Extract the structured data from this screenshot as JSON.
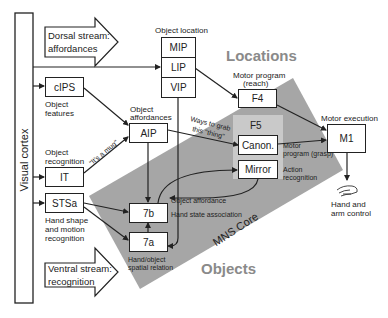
{
  "diagram": {
    "colors": {
      "mns_core": "#a6a6a6",
      "f5_region": "#c9c9c9",
      "region_label": "#8a8a8a",
      "line": "#222222"
    },
    "visual_cortex": "Visual cortex",
    "dorsal_stream": {
      "line1": "Dorsal stream:",
      "line2": "affordances"
    },
    "ventral_stream": {
      "line1": "Ventral stream:",
      "line2": "recognition"
    },
    "object_location": {
      "label": "Object location",
      "boxes": [
        "MIP",
        "LIP",
        "VIP"
      ]
    },
    "regions": {
      "locations": "Locations",
      "objects": "Objects",
      "mns_core": "MNS Core"
    },
    "nodes": {
      "cips": {
        "label": "cIPS",
        "caption1": "Object",
        "caption2": "features"
      },
      "it": {
        "label": "IT",
        "caption1": "Object",
        "caption2": "recognition"
      },
      "stsa": {
        "label": "STSa",
        "caption1": "Hand shape",
        "caption2": "and motion",
        "caption3": "recognition"
      },
      "aip": {
        "label": "AIP",
        "caption1": "Object",
        "caption2": "affordances"
      },
      "n7b": {
        "label": "7b"
      },
      "n7a": {
        "label": "7a",
        "caption1": "Hand/object",
        "caption2": "spatial relation"
      },
      "f4": {
        "label": "F4",
        "caption1": "Motor program",
        "caption2": "(reach)"
      },
      "f5": {
        "label": "F5"
      },
      "canon": {
        "label": "Canon.",
        "caption1": "Motor",
        "caption2": "program (grasp)"
      },
      "mirror": {
        "label": "Mirror",
        "caption1": "Action",
        "caption2": "recognition"
      },
      "m1": {
        "label": "M1",
        "caption1": "Motor execution"
      }
    },
    "edge_labels": {
      "its_a_mug": "\"It's a mug\"",
      "ways_to_grab1": "Ways to grab",
      "ways_to_grab2": "this \"thing\"",
      "object_affordance": "Object affordance",
      "hand_state": "Hand state association"
    },
    "output": {
      "icon": "hand-icon",
      "line1": "Hand and",
      "line2": "arm control"
    }
  }
}
